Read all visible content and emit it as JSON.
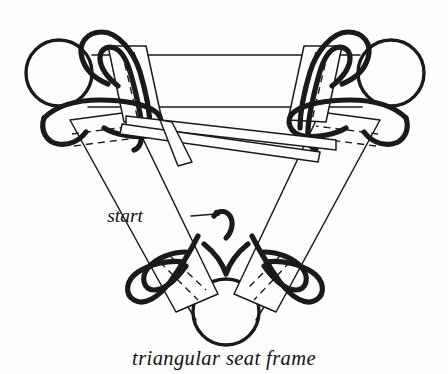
{
  "figure": {
    "title": "triangular seat frame",
    "caption": "triangular seat frame",
    "start_label": "start",
    "domain_kind": "line-drawing-diagram",
    "background_color": "#fdfdfd",
    "ink_color": "#1a1a1a",
    "width_px": 448,
    "height_px": 374,
    "icons": {
      "ball_top_left": "sphere-knob-icon",
      "ball_top_right": "sphere-knob-icon",
      "ball_bottom": "sphere-knob-icon",
      "strap_loop": "strap-loop-icon",
      "leader_line": "leader-line-icon"
    },
    "parts": [
      {
        "name": "top-left-ball",
        "cx": 59,
        "cy": 73,
        "r": 33
      },
      {
        "name": "top-right-ball",
        "cx": 391,
        "cy": 73,
        "r": 33
      },
      {
        "name": "bottom-ball",
        "cx": 226,
        "cy": 312,
        "r": 33
      },
      {
        "name": "top-frame-bar",
        "from": [
          96,
          55
        ],
        "to": [
          356,
          55
        ]
      },
      {
        "name": "lower-frame-bar",
        "from": [
          96,
          107
        ],
        "to": [
          356,
          107
        ]
      },
      {
        "name": "left-frame-rail",
        "from": [
          96,
          118
        ],
        "to": [
          200,
          300
        ]
      },
      {
        "name": "right-frame-rail",
        "from": [
          356,
          118
        ],
        "to": [
          252,
          300
        ]
      }
    ]
  }
}
